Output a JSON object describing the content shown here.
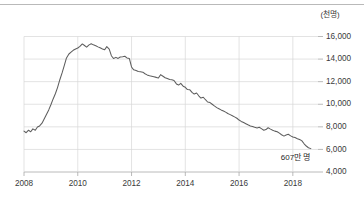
{
  "chart_data": {
    "type": "line",
    "title": "",
    "xlabel": "",
    "ylabel": "",
    "unit_label": "(천명)",
    "grid": true,
    "legend": "none",
    "xlim": [
      2008.0,
      2018.75
    ],
    "ylim": [
      4000,
      16000
    ],
    "x_ticks": [
      "2008",
      "2010",
      "2012",
      "2014",
      "2016",
      "2018"
    ],
    "x_tick_values": [
      2008,
      2010,
      2012,
      2014,
      2016,
      2018
    ],
    "y_ticks": [
      "16,000",
      "14,000",
      "12,000",
      "10,000",
      "8,000",
      "6,000",
      "4,000"
    ],
    "y_tick_values": [
      16000,
      14000,
      12000,
      10000,
      8000,
      6000,
      4000
    ],
    "annotations": [
      {
        "text": "607만 명",
        "x": 2018.1,
        "y": 5050
      }
    ],
    "series": [
      {
        "name": "",
        "color": "#5d5d5d",
        "x": [
          2008.0,
          2008.08,
          2008.17,
          2008.25,
          2008.33,
          2008.42,
          2008.5,
          2008.58,
          2008.67,
          2008.75,
          2008.83,
          2008.92,
          2009.0,
          2009.08,
          2009.17,
          2009.25,
          2009.33,
          2009.42,
          2009.5,
          2009.58,
          2009.67,
          2009.75,
          2009.83,
          2009.92,
          2010.0,
          2010.08,
          2010.17,
          2010.25,
          2010.33,
          2010.42,
          2010.5,
          2010.58,
          2010.67,
          2010.75,
          2010.83,
          2010.92,
          2011.0,
          2011.08,
          2011.17,
          2011.25,
          2011.33,
          2011.42,
          2011.5,
          2011.58,
          2011.67,
          2011.75,
          2011.83,
          2011.92,
          2012.0,
          2012.08,
          2012.17,
          2012.25,
          2012.33,
          2012.42,
          2012.5,
          2012.58,
          2012.67,
          2012.75,
          2012.83,
          2012.92,
          2013.0,
          2013.08,
          2013.17,
          2013.25,
          2013.33,
          2013.42,
          2013.5,
          2013.58,
          2013.67,
          2013.75,
          2013.83,
          2013.92,
          2014.0,
          2014.08,
          2014.17,
          2014.25,
          2014.33,
          2014.42,
          2014.5,
          2014.58,
          2014.67,
          2014.75,
          2014.83,
          2014.92,
          2015.0,
          2015.08,
          2015.17,
          2015.25,
          2015.33,
          2015.42,
          2015.5,
          2015.58,
          2015.67,
          2015.75,
          2015.83,
          2015.92,
          2016.0,
          2016.08,
          2016.17,
          2016.25,
          2016.33,
          2016.42,
          2016.5,
          2016.58,
          2016.67,
          2016.75,
          2016.83,
          2016.92,
          2017.0,
          2017.08,
          2017.17,
          2017.25,
          2017.33,
          2017.42,
          2017.5,
          2017.58,
          2017.67,
          2017.75,
          2017.83,
          2017.92,
          2018.0,
          2018.08,
          2018.17,
          2018.25,
          2018.33,
          2018.42,
          2018.5,
          2018.58,
          2018.67
        ],
        "values": [
          7620,
          7480,
          7700,
          7560,
          7820,
          7700,
          7980,
          8080,
          8320,
          8700,
          9080,
          9500,
          9950,
          10450,
          10950,
          11500,
          12150,
          12800,
          13450,
          14100,
          14450,
          14620,
          14780,
          14900,
          14980,
          15120,
          15340,
          15200,
          15060,
          15260,
          15350,
          15260,
          15180,
          15080,
          15000,
          14900,
          14820,
          15100,
          14880,
          14300,
          14050,
          14150,
          14060,
          14180,
          14200,
          14250,
          14100,
          14050,
          13300,
          13050,
          12980,
          12900,
          12880,
          12840,
          12700,
          12600,
          12520,
          12480,
          12440,
          12380,
          12320,
          12620,
          12480,
          12350,
          12280,
          12200,
          12160,
          12100,
          11800,
          11700,
          11850,
          11600,
          11500,
          11300,
          11280,
          11050,
          10900,
          11000,
          10750,
          10550,
          10620,
          10400,
          10200,
          10150,
          10000,
          9850,
          9700,
          9600,
          9500,
          9400,
          9300,
          9180,
          9080,
          8980,
          8880,
          8760,
          8600,
          8480,
          8380,
          8280,
          8180,
          8080,
          8020,
          7960,
          7900,
          7960,
          7840,
          7700,
          7760,
          7920,
          7800,
          7700,
          7620,
          7560,
          7440,
          7300,
          7180,
          7280,
          7340,
          7200,
          7100,
          7050,
          6950,
          6880,
          6780,
          6500,
          6300,
          6150,
          6070
        ]
      }
    ]
  },
  "axis": {
    "unit": "(천명)"
  }
}
